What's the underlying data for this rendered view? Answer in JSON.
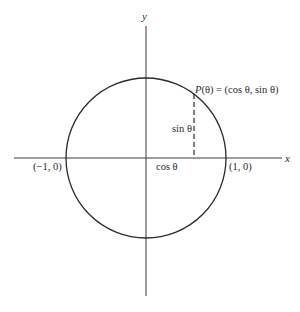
{
  "diagram": {
    "type": "unit-circle",
    "colors": {
      "stroke": "#2a2a2a",
      "axis": "#3a3a3a",
      "background": "#ffffff"
    },
    "geometry": {
      "center": [
        146,
        158
      ],
      "radius": 80,
      "point_angle_deg": 53
    },
    "axes": {
      "x_label": "x",
      "y_label": "y"
    },
    "labels": {
      "point": "P(θ) = (cos θ, sin θ)",
      "point_P": "P",
      "point_rest": "(θ) = (cos θ, sin θ)",
      "sin": "sin θ",
      "cos": "cos θ",
      "left_intercept": "(−1, 0)",
      "right_intercept": "(1, 0)"
    }
  }
}
